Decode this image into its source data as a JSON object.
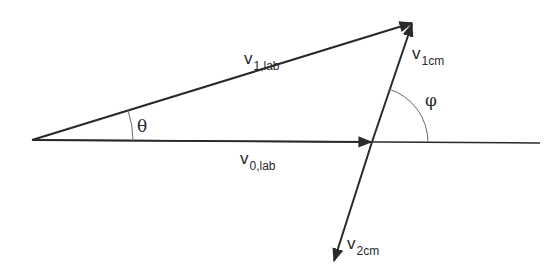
{
  "diagram": {
    "type": "vector-diagram",
    "colors": {
      "stroke": "#2a2a2a",
      "arc": "#6a6a6a",
      "background": "#ffffff"
    },
    "vectors": [
      {
        "id": "v0_lab",
        "main": "v",
        "subscript": "0,lab",
        "from": [
          32,
          140
        ],
        "to": [
          370,
          142
        ]
      },
      {
        "id": "v1_lab",
        "main": "v",
        "subscript": "1,lab",
        "from": [
          32,
          140
        ],
        "to": [
          412,
          23
        ]
      },
      {
        "id": "v1cm",
        "main": "v",
        "subscript": "1cm",
        "from": [
          372,
          142
        ],
        "to": [
          412,
          23
        ]
      },
      {
        "id": "v2cm",
        "main": "v",
        "subscript": "2cm",
        "from": [
          372,
          142
        ],
        "to": [
          333,
          262
        ]
      }
    ],
    "baseline": {
      "from": [
        32,
        140
      ],
      "to": [
        540,
        143
      ]
    },
    "angles": [
      {
        "id": "theta",
        "symbol": "θ"
      },
      {
        "id": "phi",
        "symbol": "φ"
      }
    ]
  }
}
